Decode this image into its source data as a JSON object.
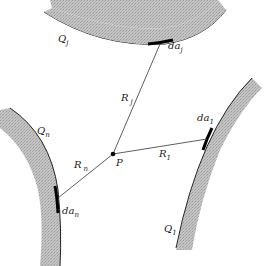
{
  "diagram": {
    "title": "",
    "point": {
      "label": "P"
    },
    "surfaces": [
      {
        "id": "j",
        "label": "Q",
        "sub": "j",
        "element_label": "da",
        "element_sub": "j",
        "distance_label": "R",
        "distance_sub": "j"
      },
      {
        "id": "1",
        "label": "Q",
        "sub": "1",
        "element_label": "da",
        "element_sub": "1",
        "distance_label": "R",
        "distance_sub": "1"
      },
      {
        "id": "n",
        "label": "Q",
        "sub": "n",
        "element_label": "da",
        "element_sub": "n",
        "distance_label": "R",
        "distance_sub": "n"
      }
    ],
    "colors": {
      "surface_fill": "#b8b8b8",
      "line": "#2a2a2a",
      "element": "#000000",
      "background": "#ffffff"
    }
  }
}
